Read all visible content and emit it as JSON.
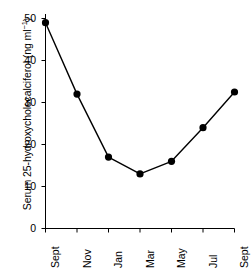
{
  "chart_data": {
    "type": "line",
    "title": "",
    "subtitle": "",
    "xlabel": "",
    "ylabel": "Serum 25-hydroxycholecalciferol (ng ml⁻¹)",
    "ylabel_main": "Serum 25-hydroxycholecalciferol (ng ml",
    "ylabel_sup": "−1",
    "ylabel_tail": ")",
    "categories": [
      "Sept",
      "Nov",
      "Jan",
      "Mar",
      "May",
      "Jul",
      "Sept"
    ],
    "values": [
      49,
      32,
      17,
      13,
      16,
      24,
      32.5
    ],
    "series": [
      {
        "name": "Serum 25-hydroxycholecalciferol",
        "values": [
          49,
          32,
          17,
          13,
          16,
          24,
          32.5
        ]
      }
    ],
    "ylim": [
      0,
      52
    ],
    "yticks": [
      0,
      10,
      20,
      30,
      40,
      50
    ],
    "ytick_labels": [
      "0",
      "10",
      "20",
      "30",
      "40",
      "50"
    ],
    "xtick_labels": [
      "Sept",
      "Nov",
      "Jan",
      "Mar",
      "May",
      "Jul",
      "Sept"
    ],
    "grid": false,
    "legend": false,
    "legend_position": "none",
    "marker": "filled-circle",
    "line_color": "#000000",
    "marker_color": "#000000",
    "axis_color": "#000000",
    "background_color": "#ffffff"
  },
  "axes": {
    "y_axis_title": "Serum 25-hydroxycholecalciferol (ng ml⁻¹)",
    "y_tick_0": "0",
    "y_tick_1": "10",
    "y_tick_2": "20",
    "y_tick_3": "30",
    "y_tick_4": "40",
    "y_tick_5": "50",
    "x_tick_0": "Sept",
    "x_tick_1": "Nov",
    "x_tick_2": "Jan",
    "x_tick_3": "Mar",
    "x_tick_4": "May",
    "x_tick_5": "Jul",
    "x_tick_6": "Sept"
  }
}
